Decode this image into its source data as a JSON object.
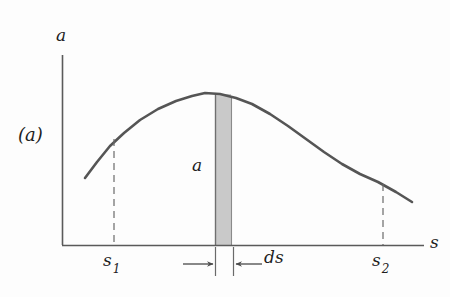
{
  "figure": {
    "panel_label": "(a)",
    "background_color": "#fdfdfd",
    "ink_color": "#4a4a4a",
    "text_color": "#1e1e1e",
    "strip_fill_color": "#c9c9c9",
    "strip_label": "a",
    "ds_label": "ds",
    "s1_label": "s",
    "s1_subscript": "1",
    "s2_label": "s",
    "s2_subscript": "2"
  },
  "chart_data": {
    "type": "line",
    "title": "",
    "subtitle": "",
    "xlabel": "s",
    "ylabel": "a",
    "grid": false,
    "legend": null,
    "annotations": [
      {
        "name": "panel-label",
        "text": "(a)",
        "x_px": 18,
        "y_px": 126
      },
      {
        "name": "strip-area-label",
        "text": "a",
        "x_px": 192,
        "y_px": 157
      },
      {
        "name": "ds-width-label",
        "text": "ds",
        "x_px": 264,
        "y_px": 249
      },
      {
        "name": "s1-tick-label",
        "text": "s1",
        "x_px": 103,
        "y_px": 252
      },
      {
        "name": "s2-tick-label",
        "text": "s2",
        "x_px": 372,
        "y_px": 252
      }
    ],
    "x_tick_labels": [
      "s1",
      "s2"
    ],
    "y_tick_labels": [],
    "axis_origin_px": {
      "x": 62,
      "y": 245
    },
    "axis_extent_px": {
      "x_end": 424,
      "y_top": 55
    },
    "series": [
      {
        "name": "acceleration-curve",
        "type": "line",
        "stroke": "#555555",
        "points_px": [
          [
            85,
            178
          ],
          [
            97,
            162
          ],
          [
            110,
            146
          ],
          [
            124,
            133
          ],
          [
            140,
            120
          ],
          [
            158,
            109
          ],
          [
            176,
            101
          ],
          [
            192,
            96
          ],
          [
            205,
            93
          ],
          [
            220,
            94
          ],
          [
            236,
            98
          ],
          [
            252,
            104
          ],
          [
            270,
            114
          ],
          [
            288,
            126
          ],
          [
            306,
            139
          ],
          [
            324,
            152
          ],
          [
            342,
            164
          ],
          [
            360,
            174
          ],
          [
            378,
            182
          ],
          [
            396,
            192
          ],
          [
            412,
            202
          ]
        ]
      }
    ],
    "markers": [
      {
        "name": "s1-dashed-dropline",
        "x_px": 114,
        "y_top_px": 139,
        "y_bottom_px": 245,
        "style": "dashed"
      },
      {
        "name": "s2-dashed-dropline",
        "x_px": 383,
        "y_top_px": 184,
        "y_bottom_px": 245,
        "style": "dashed"
      }
    ],
    "shaded_strip": {
      "name": "differential-strip",
      "x_left_px": 215,
      "x_right_px": 231,
      "y_top_px": 94,
      "y_bottom_px": 245,
      "fill": "#c9c9c9",
      "outline": "#7a7a7a"
    },
    "dimension_marks": {
      "name": "ds-dimension",
      "left_tick_x_px": 215,
      "right_tick_x_px": 233,
      "tick_top_px": 247,
      "tick_bottom_px": 276,
      "arrow_left": {
        "from_x_px": 183,
        "to_x_px": 213,
        "y_px": 264,
        "direction": "right"
      },
      "arrow_right": {
        "from_x_px": 262,
        "to_x_px": 236,
        "y_px": 264,
        "direction": "left"
      }
    }
  }
}
